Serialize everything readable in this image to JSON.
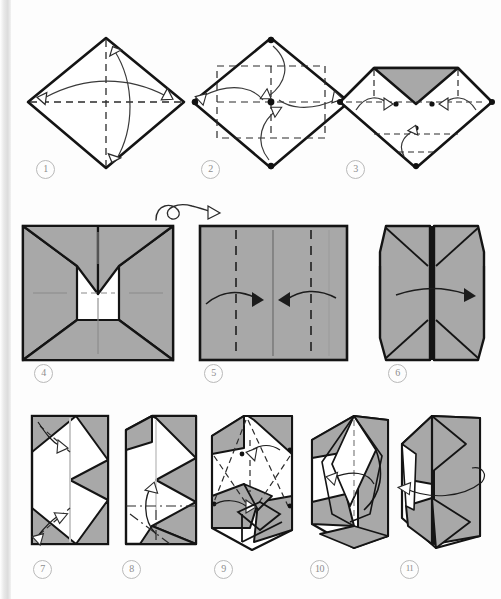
{
  "document": {
    "kind": "origami-instruction-diagram",
    "page_background": "#fdfdfd",
    "paper_colored_side": "#a8a8a8",
    "paper_white_side": "#ffffff",
    "line_color": "#1a1a1a",
    "crease_color": "#2b2b2b",
    "step_label_color": "#8d8d8d"
  },
  "steps": [
    {
      "number": "1",
      "caption_label": "1",
      "shape": "diamond",
      "description": "Square rotated 45 degrees, white side up, with both diagonals shown as valley creases. Two curved arrows fold top corner to bottom corner and left corner to right corner.",
      "creases": [
        "vertical-diagonal-dashed",
        "horizontal-diagonal-dashed"
      ],
      "arrows": 2
    },
    {
      "number": "2",
      "caption_label": "2",
      "shape": "diamond",
      "description": "Diamond with inner dashed square connecting edge midpoints. Four corner dots and one center dot. Four curved arrows bring each corner to the center.",
      "dots": [
        "top",
        "right",
        "bottom",
        "left",
        "center"
      ],
      "arrows": 4
    },
    {
      "number": "3",
      "caption_label": "3",
      "shape": "diamond-top-folded",
      "description": "Top corner already folded to center revealing the grey coloured side as a triangle. Remaining three corners marked with dots and curved arrows to fold them to centre.",
      "shaded_regions": [
        "top-triangle"
      ],
      "dots": 3,
      "arrows": 3
    },
    {
      "number": "4",
      "caption_label": "4",
      "shape": "square-blintz",
      "description": "Square with all four corners folded to centre. Grey coloured side outward, white inner square visible, top flaps forming a V. Faint creases cross the white centre.",
      "shaded_regions": [
        "left-flap",
        "right-flap",
        "top-flaps",
        "bottom-flap"
      ],
      "arrows": 0
    },
    {
      "number": "5",
      "caption_label": "5",
      "shape": "square-plain",
      "description": "Plain grey square after turning the model over. Two vertical dashed valley creases at the quarter marks and a faint vertical centre crease. Two arrows fold the left and right edges to the centre.",
      "creases": [
        "vertical-dashed-left-quarter",
        "vertical-dashed-right-quarter",
        "vertical-centre-faint"
      ],
      "arrows": 2
    },
    {
      "number": "6",
      "caption_label": "6",
      "shape": "tall-rectangle-doors",
      "description": "Both sides folded to the centre making a tall rectangle with a central vertical seam. Diagonal edges visible at the four corners. One arrow indicates folding the right door across.",
      "arrows": 1
    },
    {
      "number": "7",
      "caption_label": "7",
      "shape": "tall-rectangle-flaps",
      "description": "Tall rectangle with a white centre band, grey triangular corner flaps top-left and bottom-left and a large grey chevron on the right. Two arrows with dashed creases open the top-left and bottom-left corners.",
      "arrows": 2
    },
    {
      "number": "8",
      "caption_label": "8",
      "shape": "tall-rectangle-squashed",
      "description": "Corners squashed flat. A dash-dot mountain crease crosses the lower third and a looping arrow turns the bottom flap upward.",
      "creases": [
        "dash-dot-horizontal",
        "dash-dot-diagonal"
      ],
      "arrows": 1
    },
    {
      "number": "9",
      "caption_label": "9",
      "shape": "three-dimensional-opening",
      "description": "Model beginning to open into three dimensions. Hidden edges shown dashed, a small dot marks a reference point and two arrows indicate opening the lower pocket.",
      "arrows": 2
    },
    {
      "number": "10",
      "caption_label": "10",
      "shape": "three-dimensional-box",
      "description": "Three dimensional box-like form in perspective with grey outer faces and white inner faces. A curved arrow wraps a flap around to the right.",
      "arrows": 1
    },
    {
      "number": "11",
      "caption_label": "11",
      "shape": "three-dimensional-closed",
      "description": "Nearly finished three dimensional model, mostly grey, with a long encircling arrow indicating the wrap is complete.",
      "arrows": 1
    }
  ],
  "symbols": [
    {
      "name": "turn-over-symbol",
      "label": "turn over",
      "position": "between step 4 and step 5",
      "glyph": "looping-arrow"
    }
  ]
}
